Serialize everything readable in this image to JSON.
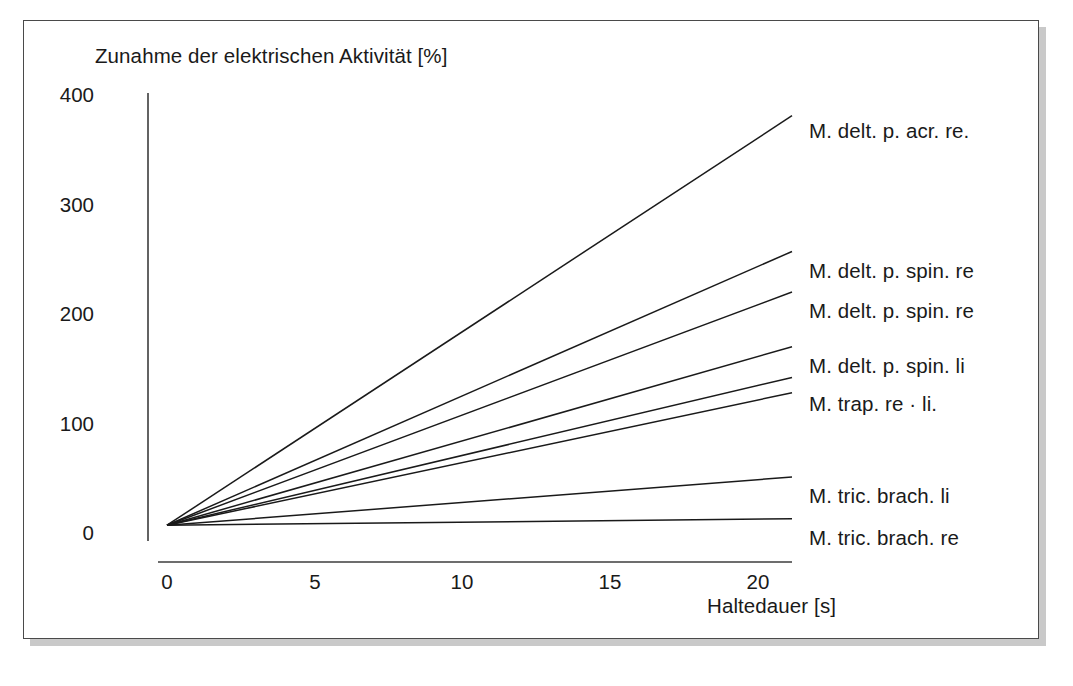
{
  "figure": {
    "background_color": "#ffffff",
    "frame_color": "#4a4a4a",
    "shadow_color": "#c9c9c9",
    "line_color": "#1a1a1a",
    "axis_color": "#3c3c3c"
  },
  "chart_data": {
    "type": "line",
    "title": "",
    "xlabel": "Haltedauer [s]",
    "ylabel": "Zunahme der elektrischen Aktivität [%]",
    "xlim": [
      0,
      20
    ],
    "ylim": [
      0,
      400
    ],
    "xticks": [
      0,
      5,
      10,
      15,
      20
    ],
    "xtick_labels": [
      "0",
      "5",
      "10",
      "15",
      "20"
    ],
    "yticks": [
      0,
      100,
      200,
      300,
      400
    ],
    "ytick_labels": [
      "0",
      "100",
      "200",
      "300",
      "400"
    ],
    "grid": false,
    "legend_position": "right-of-line-ends",
    "x": [
      0.5,
      20
    ],
    "series": [
      {
        "name": "M. delt. p. acr. re.",
        "values": [
          8,
          382
        ],
        "label_y_px": 113
      },
      {
        "name": "M. delt. p. spin. re",
        "values": [
          8,
          258
        ],
        "label_y_px": 253
      },
      {
        "name": "M. delt. p. spin. re",
        "values": [
          8,
          221
        ],
        "label_y_px": 293
      },
      {
        "name": "M. delt. p. spin. li",
        "values": [
          8,
          171
        ],
        "label_y_px": 348
      },
      {
        "name": "M. trap. re · li.",
        "values": [
          8,
          143
        ],
        "label_y_px": 386
      },
      {
        "name": "",
        "values": [
          8,
          129
        ],
        "label_y_px": null
      },
      {
        "name": "M. tric. brach. li",
        "values": [
          8,
          52
        ],
        "label_y_px": 478
      },
      {
        "name": "M. tric. brach. re",
        "values": [
          8,
          14
        ],
        "label_y_px": 520
      }
    ]
  }
}
